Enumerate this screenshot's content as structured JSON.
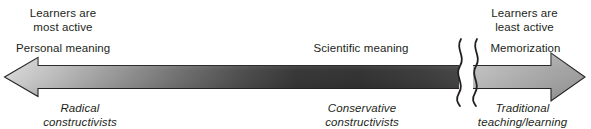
{
  "figure": {
    "type": "continuum-double-arrow-diagram",
    "title_text": "",
    "background_color": "#ffffff",
    "text_color": "#231f20",
    "axis": {
      "orientation": "horizontal",
      "double_headed": true,
      "has_break_symbol": true,
      "break_symbol": "double-wavy-line",
      "outline_color": "#231f20",
      "gradient_stops": [
        {
          "pos": "0%",
          "color": "#d4d4d4"
        },
        {
          "pos": "18%",
          "color": "#a8a8a8"
        },
        {
          "pos": "40%",
          "color": "#6e6e6e"
        },
        {
          "pos": "60%",
          "color": "#3a3a3a"
        },
        {
          "pos": "78%",
          "color": "#2b2b2b"
        },
        {
          "pos": "100%",
          "color": "#3d3d3d"
        }
      ],
      "right_segment_gradient_stops": [
        {
          "pos": "0%",
          "color": "#b6b6b6"
        },
        {
          "pos": "55%",
          "color": "#a3a3a3"
        },
        {
          "pos": "100%",
          "color": "#9a9a9a"
        }
      ]
    },
    "labels": {
      "left_top": "Learners are\nmost active",
      "left_upper": "Personal meaning",
      "left_bottom": "Radical\nconstructivists",
      "middle_upper": "Scientific meaning",
      "middle_bottom": "Conservative\nconstructivists",
      "right_top": "Learners are\nleast active",
      "right_upper": "Memorization",
      "right_bottom": "Traditional\nteaching/learning"
    }
  }
}
